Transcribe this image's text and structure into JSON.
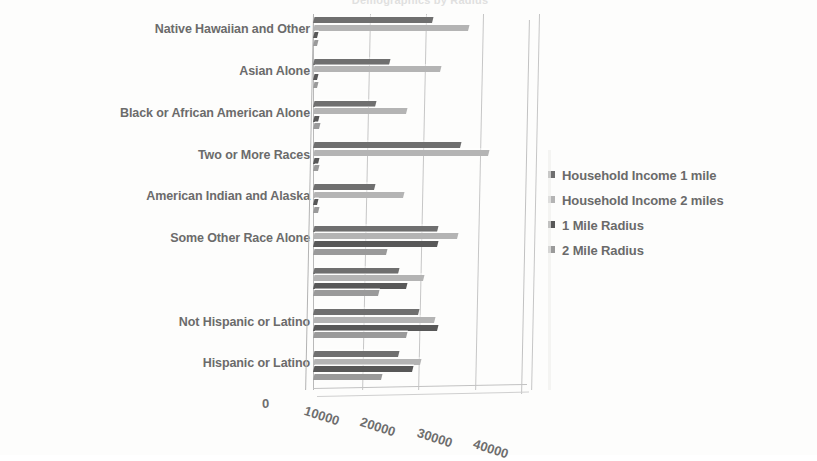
{
  "chart": {
    "title": "Demographics by Radius",
    "type": "bar"
  },
  "legend": {
    "position": "right",
    "items": [
      {
        "label": "Household Income 1 mile",
        "color": "#6f6f6f"
      },
      {
        "label": "Household Income 2 miles",
        "color": "#b4b4b4"
      },
      {
        "label": "1 Mile Radius",
        "color": "#585858"
      },
      {
        "label": "2 Mile Radius",
        "color": "#9a9a9a"
      }
    ]
  },
  "axis": {
    "x_ticks": [
      "0",
      "10000",
      "20000",
      "30000",
      "40000"
    ],
    "x_min": 0,
    "x_max": 40000
  },
  "chart_data": {
    "type": "bar",
    "title": "Demographics by Radius",
    "xlabel": "",
    "ylabel": "",
    "orientation": "horizontal",
    "xlim": [
      0,
      40000
    ],
    "grid": true,
    "legend_position": "right",
    "categories": [
      "Native Hawaiian and Other",
      "Asian Alone",
      "Black or African American Alone",
      "Two or More Races",
      "American Indian and Alaska",
      "Some Other Race Alone",
      "White Alone",
      "Not Hispanic or Latino",
      "Hispanic or Latino"
    ],
    "series": [
      {
        "name": "Household Income 1 mile",
        "color": "#6f6f6f",
        "values": [
          21000,
          13500,
          11000,
          26000,
          10800,
          22000,
          15000,
          18500,
          15000
        ]
      },
      {
        "name": "Household Income 2 miles",
        "color": "#b4b4b4",
        "values": [
          27500,
          22500,
          16500,
          31000,
          16000,
          25500,
          19500,
          21500,
          19000
        ]
      },
      {
        "name": "1 Mile Radius",
        "color": "#585858",
        "values": [
          600,
          600,
          900,
          800,
          700,
          22000,
          16500,
          22000,
          17500
        ]
      },
      {
        "name": "2 Mile Radius",
        "color": "#9a9a9a",
        "values": [
          700,
          700,
          1000,
          900,
          800,
          13000,
          11500,
          16500,
          12000
        ]
      }
    ]
  }
}
